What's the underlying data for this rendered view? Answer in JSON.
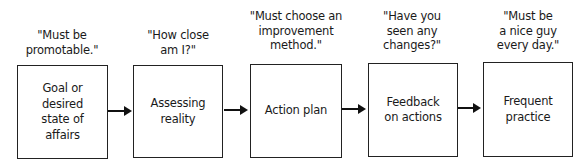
{
  "diagram": {
    "steps": [
      {
        "quote": "\"Must be\npromotable.\"",
        "label": "Goal or\ndesired\nstate of\naffairs"
      },
      {
        "quote": "\"How close\nam I?\"",
        "label": "Assessing\nreality"
      },
      {
        "quote": "\"Must choose an\nimprovement\nmethod.\"",
        "label": "Action plan"
      },
      {
        "quote": "\"Have you\nseen any\nchanges?\"",
        "label": "Feedback\non actions"
      },
      {
        "quote": "\"Must be\na nice guy\nevery day.\"",
        "label": "Frequent\npractice"
      }
    ],
    "connectors": [
      {
        "from": 0,
        "to": 1,
        "icon": "arrow-right-icon"
      },
      {
        "from": 1,
        "to": 2,
        "icon": "arrow-right-icon"
      },
      {
        "from": 2,
        "to": 3,
        "icon": "arrow-right-icon"
      },
      {
        "from": 3,
        "to": 4,
        "icon": "arrow-right-icon"
      }
    ]
  }
}
